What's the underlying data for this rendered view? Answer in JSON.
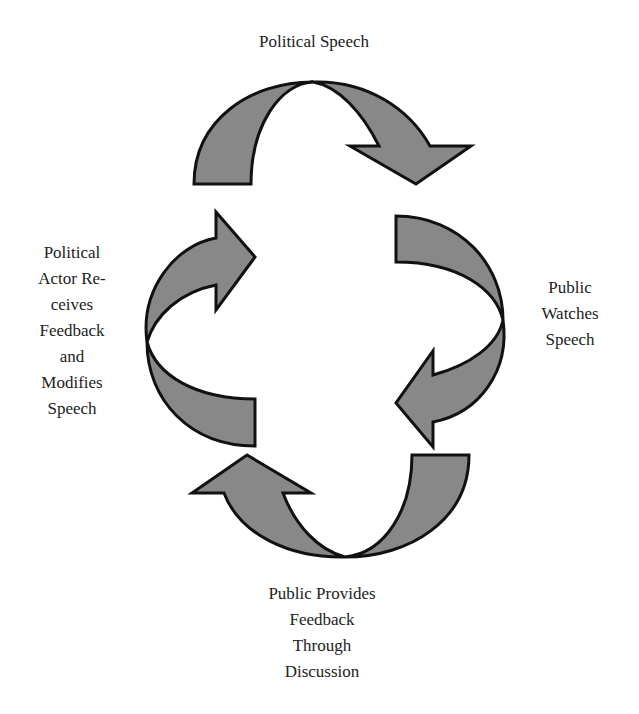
{
  "diagram": {
    "type": "cycle",
    "stages": [
      {
        "id": "top",
        "lines": [
          "Political Speech"
        ]
      },
      {
        "id": "right",
        "lines": [
          "Public",
          "Watches",
          "Speech"
        ]
      },
      {
        "id": "bottom",
        "lines": [
          "Public Provides",
          "Feedback",
          "Through",
          "Discussion"
        ]
      },
      {
        "id": "left",
        "lines": [
          "Political",
          "Actor Re-",
          "ceives",
          "Feedback",
          "and",
          "Modifies",
          "Speech"
        ]
      }
    ],
    "colors": {
      "arrow_fill": "#888888",
      "arrow_stroke": "#111111",
      "text": "#222222",
      "background": "#ffffff"
    },
    "arrow_direction": "clockwise"
  }
}
